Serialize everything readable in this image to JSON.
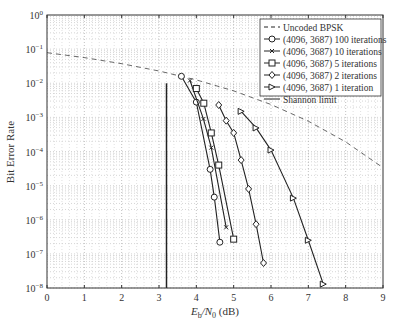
{
  "chart_data": {
    "type": "line",
    "title": "",
    "xlabel": "E_b/N_0 (dB)",
    "ylabel": "Bit Error Rate",
    "xlim": [
      0,
      9
    ],
    "ylim": [
      1e-08,
      1
    ],
    "yscale": "log",
    "grid": true,
    "legend_position": "upper right",
    "x_ticks": [
      0,
      1,
      2,
      3,
      4,
      5,
      6,
      7,
      8,
      9
    ],
    "y_ticks": [
      "10^0",
      "10^-1",
      "10^-2",
      "10^-3",
      "10^-4",
      "10^-5",
      "10^-6",
      "10^-7",
      "10^-8"
    ],
    "series": [
      {
        "name": "Uncoded BPSK",
        "style": "dashed",
        "marker": "none",
        "x": [
          0,
          1,
          2,
          3,
          4,
          5,
          6,
          7,
          8,
          9
        ],
        "y": [
          0.0786,
          0.0563,
          0.0375,
          0.0229,
          0.0125,
          0.00595,
          0.00239,
          0.000773,
          0.000191,
          3.36e-05
        ]
      },
      {
        "name": "(4096, 3687) 100 iterations",
        "marker": "circle",
        "x": [
          3.6,
          4.0,
          4.37,
          4.48,
          4.63
        ],
        "y": [
          0.016,
          0.0028,
          3e-05,
          4.6e-06,
          2.2e-07
        ]
      },
      {
        "name": "(4096, 3687) 10 iterations",
        "marker": "x",
        "x": [
          3.83,
          4.19,
          4.4,
          4.8
        ],
        "y": [
          0.012,
          0.0009,
          0.00013,
          6e-07
        ]
      },
      {
        "name": "(4096, 3687) 5 iterations",
        "marker": "square",
        "x": [
          4.0,
          4.2,
          4.4,
          4.6,
          5.0
        ],
        "y": [
          0.007,
          0.0026,
          0.00035,
          4e-05,
          2.7e-07
        ]
      },
      {
        "name": "(4096, 3687) 2 iterations",
        "marker": "diamond",
        "x": [
          4.6,
          4.8,
          5.0,
          5.2,
          5.4,
          5.6,
          5.8
        ],
        "y": [
          0.0023,
          0.0008,
          0.00035,
          5.6e-05,
          8e-06,
          7.4e-07,
          5.4e-08
        ]
      },
      {
        "name": "(4096, 3687) 1 iteration",
        "marker": "triangle-right",
        "x": [
          5.2,
          5.6,
          6.0,
          6.6,
          7.0,
          7.4
        ],
        "y": [
          0.0015,
          0.00049,
          0.00011,
          4.3e-06,
          2.5e-07,
          1.3e-08
        ]
      },
      {
        "name": "Shannon limit",
        "style": "solid",
        "marker": "none",
        "x": [
          3.2,
          3.2
        ],
        "y": [
          0.01,
          1e-08
        ]
      }
    ]
  },
  "labels": {
    "xlabel_main": "E",
    "xlabel_sub1": "b",
    "xlabel_mid": "/N",
    "xlabel_sub2": "0",
    "xlabel_end": " (dB)",
    "ylabel": "Bit Error Rate"
  }
}
